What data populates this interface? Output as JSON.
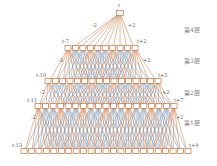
{
  "nodes": {
    "top": "t",
    "l3_left": "t-7",
    "l3_right": "t+2",
    "l2_left": "t-10",
    "l2_right": "t+5",
    "l1_left": "t-11",
    "l1_right": "t+7",
    "l0_left": "t-13",
    "l0_right": "t+9"
  },
  "edge_labels": {
    "minus": "-2",
    "plus": "+2",
    "minus3": "-3"
  },
  "layers": [
    "第4层",
    "第3层",
    "第2层",
    "第1层"
  ],
  "colors": {
    "orange": "#c8733a",
    "blue": "#7a8fa6",
    "box": "#c8733a"
  }
}
